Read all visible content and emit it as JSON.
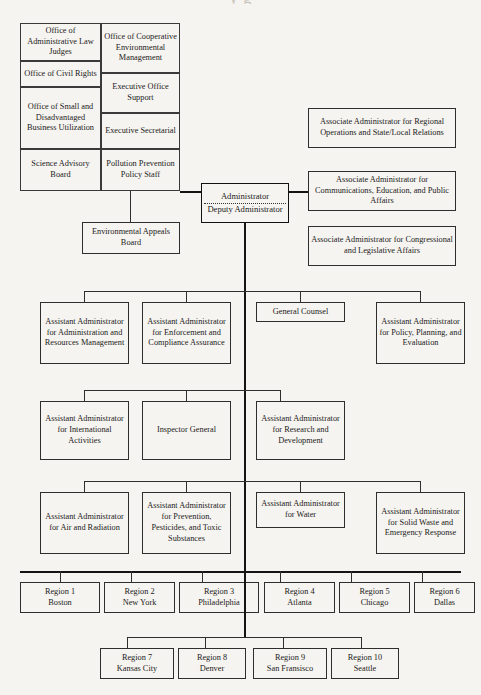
{
  "page": {
    "cut_off_title": "y  g",
    "background_color": "#f6f4f0",
    "line_color": "#2e2e2e"
  },
  "staff_grid": {
    "left_column": [
      {
        "id": "office-administrative-law-judges",
        "label": "Office of Administrative Law Judges"
      },
      {
        "id": "office-civil-rights",
        "label": "Office of Civil Rights"
      },
      {
        "id": "office-small-disadvantaged-business",
        "label": "Office of Small and Disadvantaged Business Utilization"
      },
      {
        "id": "science-advisory-board",
        "label": "Science Advisory Board"
      }
    ],
    "right_column": [
      {
        "id": "office-cooperative-environmental-management",
        "label": "Office of Cooperative Environmental Management"
      },
      {
        "id": "executive-office-support",
        "label": "Executive Office Support"
      },
      {
        "id": "executive-secretarial",
        "label": "Executive Secretarial"
      },
      {
        "id": "pollution-prevention-policy-staff",
        "label": "Pollution Prevention Policy Staff"
      }
    ]
  },
  "environmental_appeals_board": {
    "id": "environmental-appeals-board",
    "label": "Environmental Appeals Board"
  },
  "administrator": {
    "id": "administrator-deputy-administrator",
    "line1": "Administrator",
    "line2": "Deputy Administrator"
  },
  "associate_administrators": [
    {
      "id": "associate-regional-operations",
      "label": "Associate Administrator for Regional Operations and State/Local Relations"
    },
    {
      "id": "associate-communications-education",
      "label": "Associate Administrator for Communications, Education, and Public Affairs"
    },
    {
      "id": "associate-congressional-legislative",
      "label": "Associate Administrator for Congressional and Legislative Affairs"
    }
  ],
  "tier_one": [
    {
      "id": "aa-administration-resources-management",
      "label": "Assistant Administrator for Administration and Resources Management"
    },
    {
      "id": "aa-enforcement-compliance-assurance",
      "label": "Assistant Administrator for Enforcement and Compliance Assurance"
    },
    {
      "id": "general-counsel",
      "label": "General Counsel"
    },
    {
      "id": "aa-policy-planning-evaluation",
      "label": "Assistant Administrator for Policy, Planning, and Evaluation"
    }
  ],
  "tier_two": [
    {
      "id": "aa-international-activities",
      "label": "Assistant Administrator for International Activities"
    },
    {
      "id": "inspector-general",
      "label": "Inspector General"
    },
    {
      "id": "aa-research-development",
      "label": "Assistant Administrator for Research and Development"
    }
  ],
  "tier_three": [
    {
      "id": "aa-air-radiation",
      "label": "Assistant Administrator for Air and Radiation"
    },
    {
      "id": "aa-prevention-pesticides-toxic",
      "label": "Assistant Administrator for Prevention, Pesticides, and Toxic Substances"
    },
    {
      "id": "aa-water",
      "label": "Assistant Administrator for Water"
    },
    {
      "id": "aa-solid-waste-emergency-response",
      "label": "Assistant Administrator for Solid Waste and Emergency Response"
    }
  ],
  "regions_row_one": [
    {
      "id": "region-1",
      "number": "Region 1",
      "city": "Boston"
    },
    {
      "id": "region-2",
      "number": "Region 2",
      "city": "New York"
    },
    {
      "id": "region-3",
      "number": "Region 3",
      "city": "Philadelphia"
    },
    {
      "id": "region-4",
      "number": "Region 4",
      "city": "Atlanta"
    },
    {
      "id": "region-5",
      "number": "Region 5",
      "city": "Chicago"
    },
    {
      "id": "region-6",
      "number": "Region 6",
      "city": "Dallas"
    }
  ],
  "regions_row_two": [
    {
      "id": "region-7",
      "number": "Region 7",
      "city": "Kansas City"
    },
    {
      "id": "region-8",
      "number": "Region 8",
      "city": "Denver"
    },
    {
      "id": "region-9",
      "number": "Region 9",
      "city": "San Fransisco"
    },
    {
      "id": "region-10",
      "number": "Region 10",
      "city": "Seattle"
    }
  ]
}
